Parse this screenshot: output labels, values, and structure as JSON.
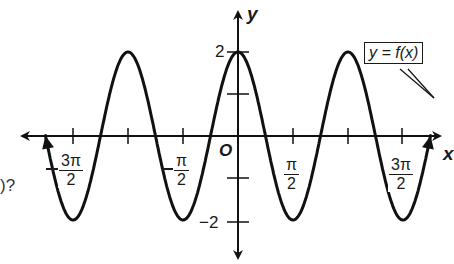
{
  "chart_data": {
    "type": "line",
    "title": "",
    "function_label": "y = f(x)",
    "xlabel": "x",
    "ylabel": "y",
    "origin_label": "O",
    "x_ticks": [
      {
        "value": -4.712,
        "label": "-3π/2",
        "numerator": "3π",
        "denominator": "2",
        "negative": true
      },
      {
        "value": -3.1416,
        "label": "",
        "numerator": "",
        "denominator": "",
        "negative": true
      },
      {
        "value": -1.5708,
        "label": "-π/2",
        "numerator": "π",
        "denominator": "2",
        "negative": true
      },
      {
        "value": 1.5708,
        "label": "π/2",
        "numerator": "π",
        "denominator": "2",
        "negative": false
      },
      {
        "value": 3.1416,
        "label": "",
        "numerator": "",
        "denominator": "",
        "negative": false
      },
      {
        "value": 4.712,
        "label": "3π/2",
        "numerator": "3π",
        "denominator": "2",
        "negative": false
      }
    ],
    "y_ticks": [
      {
        "value": 2,
        "label": "2"
      },
      {
        "value": 1,
        "label": ""
      },
      {
        "value": -1,
        "label": ""
      },
      {
        "value": -2,
        "label": "-2"
      }
    ],
    "xlim": [
      -6.2,
      6.7
    ],
    "ylim": [
      -2.9,
      2.9
    ],
    "grid": false,
    "series": [
      {
        "name": "y = f(x)",
        "expression": "2cos(2x)",
        "amplitude": 2,
        "period": 3.1416,
        "x": [
          -5.5,
          -4.712,
          -3.927,
          -3.1416,
          -2.356,
          -1.5708,
          -0.785,
          0,
          0.785,
          1.5708,
          2.356,
          3.1416,
          3.927,
          4.712,
          5.5
        ],
        "values": [
          2.0,
          -2,
          0,
          2,
          0,
          -2,
          0,
          2,
          0,
          -2,
          0,
          2,
          0,
          -2,
          2.0
        ]
      }
    ],
    "maxima": [
      [
        -3.1416,
        2
      ],
      [
        0,
        2
      ],
      [
        3.1416,
        2
      ]
    ],
    "minima": [
      [
        -4.712,
        -2
      ],
      [
        -1.5708,
        -2
      ],
      [
        1.5708,
        -2
      ],
      [
        4.712,
        -2
      ]
    ],
    "line_color": "#111111"
  },
  "labels": {
    "y_axis": "y",
    "x_axis": "x",
    "origin": "O",
    "y_two": "2",
    "y_neg_two": "−2",
    "callout": "y = f(x)",
    "fragment_left": ")?"
  },
  "fractions": {
    "neg_three_pi_half": {
      "num": "3π",
      "den": "2"
    },
    "neg_pi_half": {
      "num": "π",
      "den": "2"
    },
    "pi_half": {
      "num": "π",
      "den": "2"
    },
    "three_pi_half": {
      "num": "3π",
      "den": "2"
    }
  }
}
